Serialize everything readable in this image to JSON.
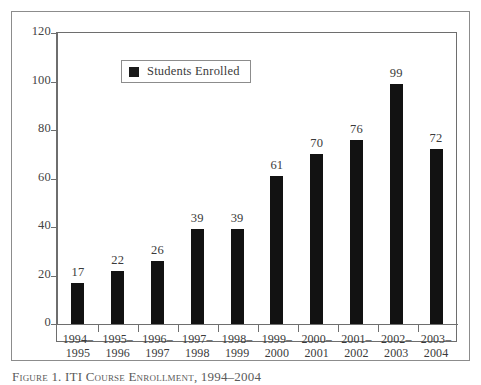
{
  "chart_data": {
    "type": "bar",
    "title": "",
    "xlabel": "",
    "ylabel": "",
    "ylim": [
      0,
      120
    ],
    "yticks": [
      0,
      20,
      40,
      60,
      80,
      100,
      120
    ],
    "grid": false,
    "legend_position": "top-left",
    "bar_color": "#121212",
    "categories": [
      "1994–1995",
      "1995–1996",
      "1996–1997",
      "1997–1998",
      "1998–1999",
      "1999–2000",
      "2000–2001",
      "2001–2002",
      "2002–2003",
      "2003–2004"
    ],
    "category_lines": [
      [
        "1994–",
        "1995"
      ],
      [
        "1995–",
        "1996"
      ],
      [
        "1996–",
        "1997"
      ],
      [
        "1997–",
        "1998"
      ],
      [
        "1998–",
        "1999"
      ],
      [
        "1999–",
        "2000"
      ],
      [
        "2000–",
        "2001"
      ],
      [
        "2001–",
        "2002"
      ],
      [
        "2002–",
        "2003"
      ],
      [
        "2003–",
        "2004"
      ]
    ],
    "series": [
      {
        "name": "Students Enrolled",
        "values": [
          17,
          22,
          26,
          39,
          39,
          61,
          70,
          76,
          99,
          72
        ]
      }
    ]
  },
  "legend": {
    "label": "Students Enrolled",
    "swatch_color": "#1a1a1a"
  },
  "caption": {
    "text": "Figure 1. ITI Course Enrollment, 1994–2004"
  }
}
